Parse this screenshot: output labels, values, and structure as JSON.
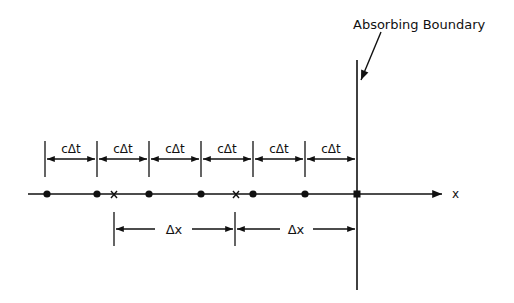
{
  "diagram": {
    "title_annotation": "Absorbing Boundary",
    "axis_label": "x",
    "time_step_label": "cΔt",
    "space_step_label": "Δx",
    "time_step_labels": [
      "cΔt",
      "cΔt",
      "cΔt",
      "cΔt",
      "cΔt",
      "cΔt"
    ],
    "space_step_labels": [
      "Δx",
      "Δx"
    ],
    "grid_points_time": 6,
    "grid_points_space": 2,
    "colors": {
      "ink": "#111111",
      "background": "#ffffff"
    }
  }
}
